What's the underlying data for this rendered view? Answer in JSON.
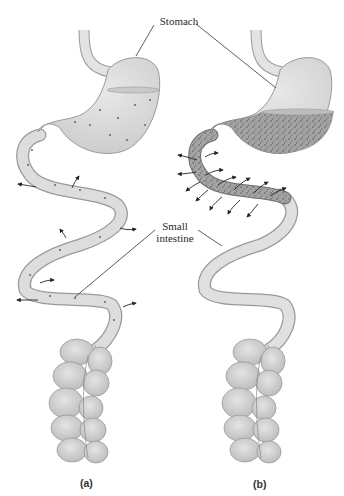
{
  "figure": {
    "labels": {
      "stomach": "Stomach",
      "small_intestine_line1": "Small",
      "small_intestine_line2": "intestine"
    },
    "panels": [
      {
        "id": "a",
        "label": "(a)",
        "description": "Stomach with sparse particles; few outward arrows along small intestine"
      },
      {
        "id": "b",
        "label": "(b)",
        "description": "Stomach and upper small intestine densely filled with particles; many outward arrows"
      }
    ],
    "colors": {
      "organ_fill": "#d9d9d9",
      "organ_fill_light": "#e6e6e6",
      "organ_stroke": "#9a9a9a",
      "dense_fill": "#9c9c9c",
      "leader_line": "#333333",
      "arrow": "#222222"
    }
  }
}
